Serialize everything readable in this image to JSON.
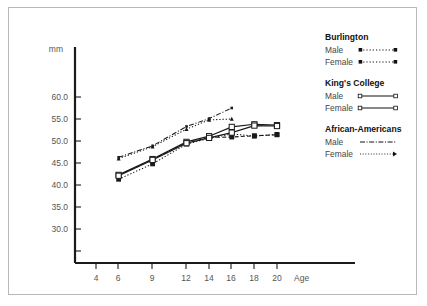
{
  "chart_data": {
    "type": "line",
    "title": "",
    "xlabel": "Age",
    "ylabel": "mm",
    "xlim": [
      3,
      21.5
    ],
    "ylim": [
      28,
      63
    ],
    "grid": false,
    "x_ticks": [
      4,
      6,
      9,
      12,
      14,
      16,
      18,
      20
    ],
    "y_ticks": [
      "30.0",
      "35.0",
      "40.0",
      "45.0",
      "50.0",
      "55.0",
      "60.0"
    ],
    "y_tick_values": [
      30.0,
      35.0,
      40.0,
      45.0,
      50.0,
      55.0,
      60.0
    ],
    "legend_position": "right",
    "series": [
      {
        "name": "Burlington Male",
        "group": "Burlington",
        "sex": "Male",
        "marker": "filled-square",
        "dash": "dotted",
        "x": [
          6,
          9,
          12,
          14,
          16,
          18,
          20
        ],
        "values": [
          41.3,
          44.8,
          49.3,
          50.6,
          51.6,
          51.1,
          51.5
        ]
      },
      {
        "name": "Burlington Female",
        "group": "Burlington",
        "sex": "Female",
        "marker": "filled-square",
        "dash": "dashed",
        "x": [
          6,
          9,
          12,
          14,
          16,
          18,
          20
        ],
        "values": [
          42.2,
          45.8,
          49.6,
          50.8,
          50.9,
          51.2,
          51.4
        ]
      },
      {
        "name": "King's College Male",
        "group": "King's College",
        "sex": "Male",
        "marker": "open-square",
        "dash": "solid",
        "x": [
          6,
          9,
          12,
          14,
          16,
          18,
          20
        ],
        "values": [
          42.3,
          45.9,
          49.8,
          51.1,
          53.2,
          53.8,
          53.6
        ]
      },
      {
        "name": "King's College Female",
        "group": "King's College",
        "sex": "Female",
        "marker": "open-square",
        "dash": "solid",
        "x": [
          6,
          9,
          12,
          14,
          16,
          18,
          20
        ],
        "values": [
          42.1,
          45.7,
          49.5,
          50.7,
          51.9,
          53.5,
          53.4
        ]
      },
      {
        "name": "African-Americans Male",
        "group": "African-Americans",
        "sex": "Male",
        "marker": "small-dot",
        "dash": "dash-dot",
        "x": [
          6,
          9,
          12,
          14,
          16
        ],
        "values": [
          46.3,
          48.9,
          53.3,
          55.1,
          57.5
        ]
      },
      {
        "name": "African-Americans Female",
        "group": "African-Americans",
        "sex": "Female",
        "marker": "small-triangle",
        "dash": "dotted",
        "x": [
          6,
          9,
          12,
          14,
          16
        ],
        "values": [
          46.0,
          48.7,
          52.7,
          54.8,
          55.0
        ]
      }
    ]
  },
  "legend": {
    "groups": [
      {
        "title": "Burlington",
        "items": [
          {
            "label": "Male",
            "style": "burlington-male"
          },
          {
            "label": "Female",
            "style": "burlington-female"
          }
        ]
      },
      {
        "title": "King's College",
        "items": [
          {
            "label": "Male",
            "style": "kings-male"
          },
          {
            "label": "Female",
            "style": "kings-female"
          }
        ]
      },
      {
        "title": "African-Americans",
        "items": [
          {
            "label": "Male",
            "style": "aa-male"
          },
          {
            "label": "Female",
            "style": "aa-female"
          }
        ]
      }
    ]
  },
  "axes": {
    "y_unit_label": "mm",
    "x_axis_name": "Age"
  },
  "colors": {
    "line": "#1a1a1a",
    "text": "#555555",
    "heading": "#111111",
    "frame": "#b8b8b8",
    "background": "#ffffff"
  }
}
